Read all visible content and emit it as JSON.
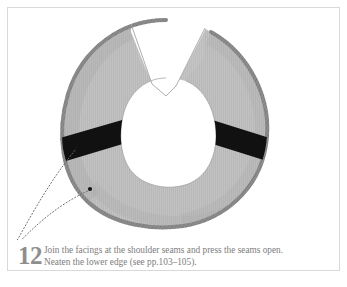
{
  "panel": {
    "border_color": "#d9d9d9",
    "background": "#ffffff"
  },
  "illustration": {
    "name": "horseshoe-shaped-neck-facing-with-shoulder-seams",
    "description": "Gray fabric horseshoe / U-shaped neck facing with two black diagonal shoulder-seam bands and an overlocked lower edge",
    "colors": {
      "fabric": "#b6b6b6",
      "fabric_light": "#c4c4c4",
      "fabric_shadow": "#a8a8a8",
      "serged_edge": "#8d8d8d",
      "seam_band": "#111111",
      "leader_line": "#6e6e6e",
      "marker_dot": "#1a1a1a"
    },
    "parts": [
      {
        "label": "left front facing flap",
        "name": "left-front-flap"
      },
      {
        "label": "right front facing flap",
        "name": "right-front-flap"
      },
      {
        "label": "left shoulder seam",
        "name": "left-shoulder-seam-band"
      },
      {
        "label": "right shoulder seam",
        "name": "right-shoulder-seam-band"
      },
      {
        "label": "neatened lower edge",
        "name": "neatened-lower-edge"
      }
    ],
    "leader_lines": [
      {
        "name": "leader-line-shoulder-seam",
        "from": "14,245",
        "to": "76,148"
      },
      {
        "name": "leader-line-lower-edge",
        "from": "14,247",
        "to": "91,190"
      }
    ]
  },
  "caption": {
    "step_number": "12",
    "line1": "Join the facings at the shoulder seams and press the seams open.",
    "line2": "Neaten the lower edge (see pp.103–105)."
  }
}
